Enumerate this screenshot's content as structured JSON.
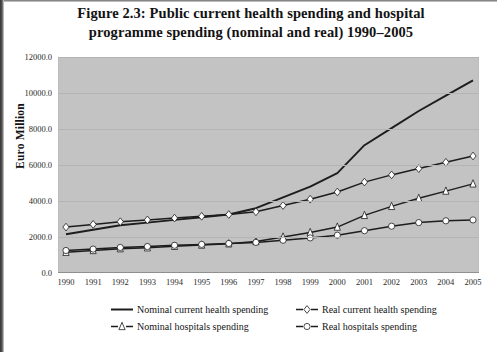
{
  "figure": {
    "title_line1": "Figure 2.3: Public current health spending and hospital",
    "title_line2": "programme spending (nominal and real) 1990–2005"
  },
  "colors": {
    "plot_background": "#c3c3c3",
    "line": "#1d1d1d",
    "marker_fill": "#ffffff",
    "gridline": "#b4b4b4",
    "text": "#131313"
  },
  "legend": {
    "position": "below-plot",
    "items": [
      {
        "label": "Nominal current health spending",
        "marker": "none"
      },
      {
        "label": "Nominal hospitals spending",
        "marker": "triangle"
      },
      {
        "label": "Real current health spending",
        "marker": "diamond"
      },
      {
        "label": "Real hospitals spending",
        "marker": "circle"
      }
    ]
  },
  "chart_data": {
    "type": "line",
    "title": "Figure 2.3: Public current health spending and hospital programme spending (nominal and real) 1990–2005",
    "xlabel": "",
    "ylabel": "Euro Million",
    "x": [
      1990,
      1991,
      1992,
      1993,
      1994,
      1995,
      1996,
      1997,
      1998,
      1999,
      2000,
      2001,
      2002,
      2003,
      2004,
      2005
    ],
    "categories": [
      "1990",
      "1991",
      "1992",
      "1993",
      "1994",
      "1995",
      "1996",
      "1997",
      "1998",
      "1999",
      "2000",
      "2001",
      "2002",
      "2003",
      "2004",
      "2005"
    ],
    "xtick_labels": [
      "1990",
      "1991",
      "1992",
      "1993",
      "1994",
      "1995",
      "1996",
      "1997",
      "1998",
      "1999",
      "2000",
      "2001",
      "2002",
      "2003",
      "2004",
      "2005"
    ],
    "ytick_labels": [
      "0.0",
      "2000.0",
      "4000.0",
      "6000.0",
      "8000.0",
      "10000.0",
      "12000.0"
    ],
    "yticks": [
      0,
      2000,
      4000,
      6000,
      8000,
      10000,
      12000
    ],
    "ylim": [
      0,
      12000
    ],
    "xlim": [
      1990,
      2005
    ],
    "grid": true,
    "legend_position": "below",
    "series": [
      {
        "name": "Nominal current health spending",
        "marker": "none",
        "values": [
          2150,
          2400,
          2650,
          2800,
          2950,
          3100,
          3250,
          3600,
          4200,
          4800,
          5550,
          7100,
          8050,
          9000,
          9850,
          10700
        ]
      },
      {
        "name": "Real current health spending",
        "marker": "diamond",
        "values": [
          2550,
          2700,
          2850,
          2950,
          3050,
          3150,
          3250,
          3400,
          3750,
          4100,
          4500,
          5050,
          5450,
          5800,
          6150,
          6500
        ]
      },
      {
        "name": "Nominal hospitals spending",
        "marker": "triangle",
        "values": [
          1150,
          1250,
          1350,
          1400,
          1480,
          1550,
          1620,
          1750,
          2000,
          2250,
          2550,
          3200,
          3700,
          4150,
          4550,
          4950
        ]
      },
      {
        "name": "Real hospitals spending",
        "marker": "circle",
        "values": [
          1250,
          1330,
          1420,
          1470,
          1540,
          1590,
          1640,
          1700,
          1820,
          1950,
          2100,
          2350,
          2600,
          2800,
          2900,
          2950
        ]
      }
    ]
  }
}
